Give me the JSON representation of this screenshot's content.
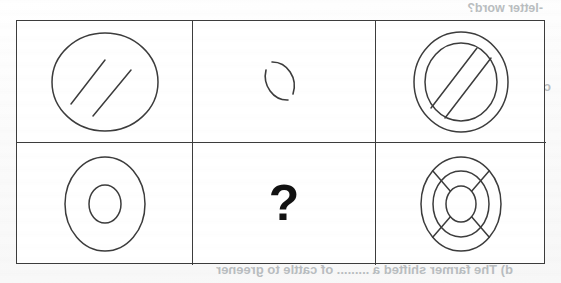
{
  "page": {
    "type": "scanned-worksheet",
    "background_color": "#fdfdfd",
    "ink_color": "#3c3c3c",
    "question_mark": "?"
  },
  "grid": {
    "rows": 2,
    "columns": 3,
    "border_color": "#3c3c3c",
    "cells": [
      {
        "id": "cell-1",
        "position": "top-left",
        "figure": "circle-two-diagonal-lines",
        "description": "Circle containing two parallel diagonal lines"
      },
      {
        "id": "cell-2",
        "position": "top-middle",
        "figure": "broken-circle-arcs",
        "description": "Small circle drawn as two broken arcs"
      },
      {
        "id": "cell-3",
        "position": "top-right",
        "figure": "double-circle-two-diagonals",
        "description": "Two concentric circles with two parallel diagonal lines"
      },
      {
        "id": "cell-4",
        "position": "bottom-left",
        "figure": "two-concentric-circles",
        "description": "Two concentric circles forming a ring"
      },
      {
        "id": "cell-5",
        "position": "bottom-middle",
        "figure": "question-mark",
        "description": "Missing answer marked with a question mark"
      },
      {
        "id": "cell-6",
        "position": "bottom-right",
        "figure": "three-concentric-circles-four-spokes",
        "description": "Three concentric circles with four diagonal spokes"
      }
    ]
  },
  "bleedthrough": {
    "note": "Faint mirrored text showing through from the reverse side of the page",
    "color": "#b9bdc0",
    "lines": [
      "-letter word?",
      "c) Write the correct collective noun in the space provided:",
      "swarm, herd, chain, bed",
      "a) This is part of a large ......... of islands known as the",
      "Hawaiian Islands.\"",
      "b) A ......... of athletes were warming up for their next",
      "race.",
      "c) Her feet were severely cut on a ......... of oysters",
      "d) The farmer shifted a ......... of cattle to greener"
    ]
  }
}
